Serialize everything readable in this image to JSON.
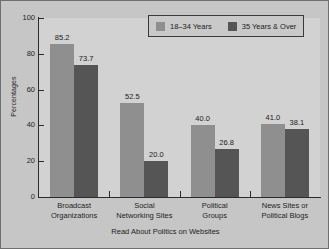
{
  "chart_data": {
    "type": "bar",
    "title": "",
    "xlabel": "Read About Politics on Websites",
    "ylabel": "Percentages",
    "ylim": [
      0,
      100
    ],
    "yticks": [
      0,
      20,
      40,
      60,
      80,
      100
    ],
    "ytick_labels": [
      "0",
      "20",
      "40",
      "60",
      "80",
      "100"
    ],
    "grid": false,
    "legend_position": "top-right",
    "categories": [
      "Broadcast\nOrganizations",
      "Social\nNetworking Sites",
      "Political\nGroups",
      "News Sites or\nPolitical Blogs"
    ],
    "category_lines": [
      [
        "Broadcast",
        "Organizations"
      ],
      [
        "Social",
        "Networking Sites"
      ],
      [
        "Political",
        "Groups"
      ],
      [
        "News Sites or",
        "Political Blogs"
      ]
    ],
    "series": [
      {
        "name": "18–34 Years",
        "color": "#8f8f8f",
        "values": [
          85.2,
          52.5,
          40.0,
          41.0
        ],
        "labels": [
          "85.2",
          "52.5",
          "40.0",
          "41.0"
        ]
      },
      {
        "name": "35 Years & Over",
        "color": "#555555",
        "values": [
          73.7,
          20.0,
          26.8,
          38.1
        ],
        "labels": [
          "73.7",
          "20.0",
          "26.8",
          "38.1"
        ]
      }
    ]
  },
  "colors": {
    "figure_background": "#c6c6c6",
    "plot_background": "#d2d2d2",
    "axis": "#2b2b2b",
    "series_a": "#8f8f8f",
    "series_b": "#555555",
    "text": "#1e1e1e"
  },
  "legend": {
    "items": [
      {
        "label": "18–34 Years",
        "color": "#8f8f8f"
      },
      {
        "label": "35 Years & Over",
        "color": "#555555"
      }
    ]
  }
}
